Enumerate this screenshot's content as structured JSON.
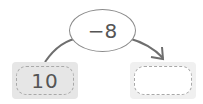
{
  "diagram": {
    "start_value": "10",
    "operation": "−8",
    "answer_value": "",
    "colors": {
      "line": "#6e6e6e",
      "box_fill": "#e6e6e6",
      "dash": "#a8a8a8",
      "text": "#555555"
    }
  }
}
